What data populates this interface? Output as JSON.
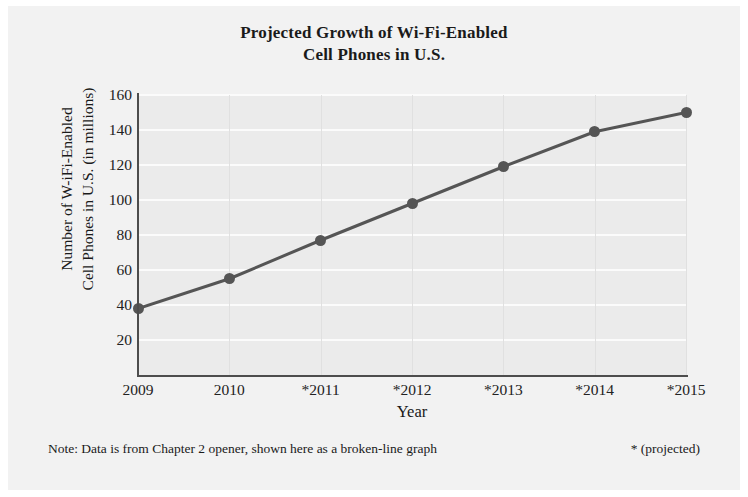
{
  "chart_data": {
    "type": "line",
    "title": "Projected Growth of Wi-Fi-Enabled Cell Phones in U.S.",
    "title_lines": [
      "Projected Growth of Wi-Fi-Enabled",
      "Cell Phones in U.S."
    ],
    "xlabel": "Year",
    "ylabel": "Number of W-iFi-Enabled Cell Phones in U.S. (in millions)",
    "ylabel_lines": [
      "Number of W-iFi-Enabled",
      "Cell Phones in U.S. (in millions)"
    ],
    "categories": [
      "2009",
      "2010",
      "*2011",
      "*2012",
      "*2013",
      "*2014",
      "*2015"
    ],
    "values": [
      38,
      55,
      77,
      98,
      119,
      139,
      150
    ],
    "yticks": [
      20,
      40,
      60,
      80,
      100,
      120,
      140,
      160
    ],
    "ylim": [
      0,
      160
    ],
    "grid": "horizontal-and-vertical",
    "legend": "none",
    "line_color": "#555555",
    "marker_color": "#555555",
    "plot_background": "#ebebeb",
    "gridline_color": "#fbfbfb",
    "notes": {
      "source": "Note: Data is from Chapter 2 opener, shown here as a broken-line graph",
      "projected": "* (projected)"
    }
  }
}
